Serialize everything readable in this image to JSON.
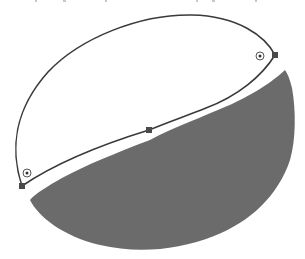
{
  "figure": {
    "colors": {
      "background": "#ffffff",
      "stroke": "#3a3a3a",
      "fill": "#6b6b6b",
      "anchor": "#4a4a4a",
      "marker": "#555555"
    },
    "outlined_path": {
      "anchors": [
        {
          "name": "left-anchor",
          "x": 22,
          "y": 186
        },
        {
          "name": "middle-anchor",
          "x": 149,
          "y": 130
        },
        {
          "name": "right-anchor",
          "x": 275,
          "y": 55
        }
      ],
      "markers": [
        {
          "name": "left-target-marker",
          "x": 27,
          "y": 173
        },
        {
          "name": "right-target-marker",
          "x": 260,
          "y": 56
        }
      ]
    },
    "filled_shape": {
      "label": "lower lobe (filled)"
    }
  }
}
